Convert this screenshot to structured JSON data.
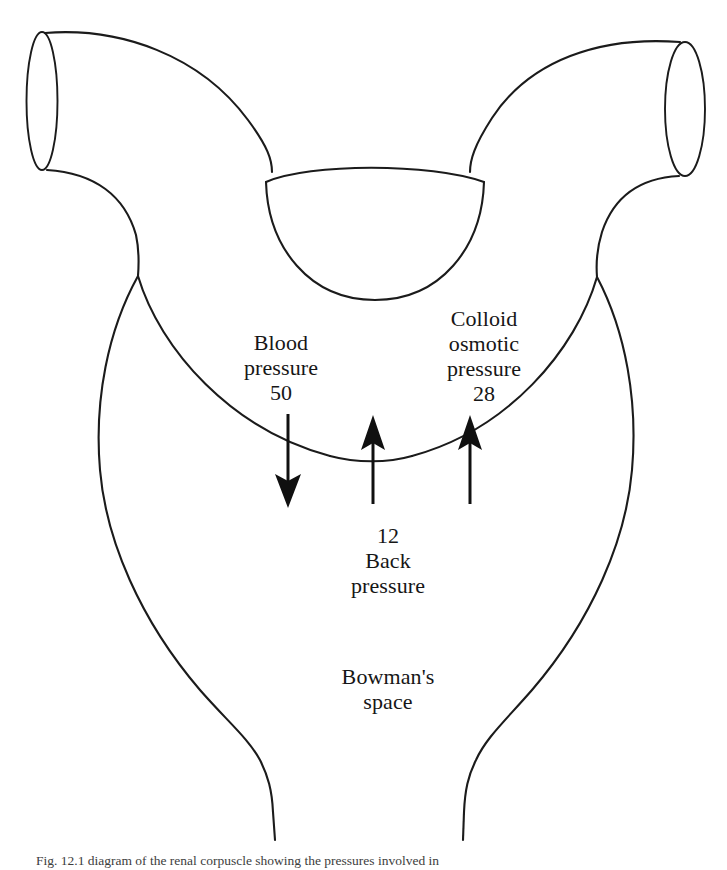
{
  "figure": {
    "domain": "Diagram",
    "background_color": "#ffffff",
    "stroke_color": "#1b1b1b",
    "text_color": "#161616",
    "caption_tag": "Fig. 12.1",
    "caption_text": "Fig. 12.1 diagram of the renal corpuscle showing the pressures involved in"
  },
  "labels": {
    "blood_pressure": "Blood\npressure\n50",
    "colloid_osmotic_pressure": "Colloid\nosmotic\npressure\n28",
    "back_pressure": "12\nBack\npressure",
    "bowmans_space": "Bowman's\nspace"
  },
  "pressures": [
    {
      "name": "Blood pressure",
      "value": 50,
      "unit": "mmHg",
      "direction": "outward",
      "arrow": "down"
    },
    {
      "name": "Colloid osmotic pressure",
      "value": 28,
      "unit": "mmHg",
      "direction": "inward",
      "arrow": "up"
    },
    {
      "name": "Back pressure",
      "value": 12,
      "unit": "mmHg",
      "direction": "inward",
      "arrow": "up"
    }
  ],
  "anatomy": {
    "afferent_arteriole": "afferent-arteriole",
    "efferent_arteriole": "efferent-arteriole",
    "glomerular_tuft": "glomerular-tuft",
    "bowmans_capsule": "bowmans-capsule",
    "proximal_tubule": "proximal-tubule"
  },
  "arrows": {
    "blood_pressure_arrow": "down-arrow",
    "back_pressure_arrow": "up-arrow",
    "colloid_osmotic_arrow": "up-arrow"
  }
}
